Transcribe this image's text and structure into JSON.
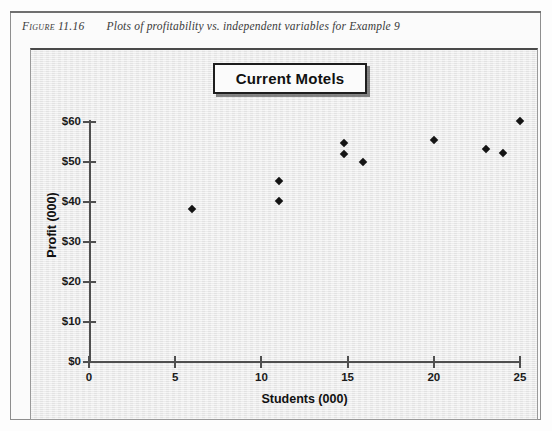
{
  "caption": {
    "label": "Figure 11.16",
    "text": "Plots of profitability vs. independent variables for Example 9"
  },
  "chart": {
    "title": "Current Motels"
  },
  "chart_data": {
    "type": "scatter",
    "title": "Current Motels",
    "xlabel": "Students (000)",
    "ylabel": "Profit (000)",
    "xlim": [
      0,
      25
    ],
    "ylim": [
      0,
      60
    ],
    "grid": false,
    "legend": false,
    "xticks": [
      "0",
      "5",
      "10",
      "15",
      "20",
      "25"
    ],
    "xtick_values": [
      0,
      5,
      10,
      15,
      20,
      25
    ],
    "yticks": [
      "$0",
      "$10",
      "$20",
      "$30",
      "$40",
      "$50",
      "$60"
    ],
    "ytick_values": [
      0,
      10,
      20,
      30,
      40,
      50,
      60
    ],
    "marker": "diamond",
    "marker_color": "#141414",
    "points": [
      {
        "x": 6.0,
        "y": 38.3
      },
      {
        "x": 11.0,
        "y": 45.2
      },
      {
        "x": 11.0,
        "y": 40.3
      },
      {
        "x": 14.8,
        "y": 54.8
      },
      {
        "x": 14.8,
        "y": 52.1
      },
      {
        "x": 15.9,
        "y": 50.1
      },
      {
        "x": 20.0,
        "y": 55.5
      },
      {
        "x": 23.0,
        "y": 53.2
      },
      {
        "x": 24.0,
        "y": 52.3
      },
      {
        "x": 25.0,
        "y": 60.3
      }
    ]
  },
  "colors": {
    "panel_background": "#e9e9e9",
    "axis": "#4f4f4f",
    "marker": "#141414",
    "title_border": "#1d1d1d",
    "page_background": "#fbfbfb"
  }
}
